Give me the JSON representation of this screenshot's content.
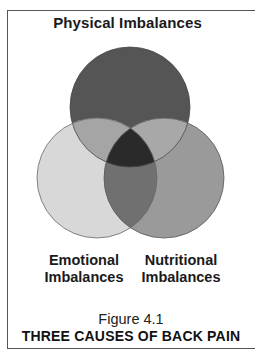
{
  "diagram": {
    "type": "venn",
    "top_label": "Physical Imbalances",
    "circles": [
      {
        "id": "physical",
        "label": "Physical Imbalances",
        "cx": 130,
        "cy": 107,
        "r": 60,
        "fill": "#555555"
      },
      {
        "id": "emotional",
        "label": "Emotional Imbalances",
        "cx": 97,
        "cy": 178,
        "r": 60,
        "fill": "#d8d8d8"
      },
      {
        "id": "nutritional",
        "label": "Nutritional Imbalances",
        "cx": 164,
        "cy": 178,
        "r": 60,
        "fill": "#9a9a9a"
      }
    ],
    "overlap_colors": {
      "physical_emotional": "#a5a5a5",
      "physical_nutritional": "#a8a8a8",
      "emotional_nutritional": "#707070",
      "all_three": "#2a2a2a"
    },
    "labels": {
      "emotional_line1": "Emotional",
      "emotional_line2": "Imbalances",
      "nutritional_line1": "Nutritional",
      "nutritional_line2": "Imbalances"
    }
  },
  "caption": {
    "figure_number": "Figure 4.1",
    "title": "THREE CAUSES OF BACK PAIN"
  }
}
